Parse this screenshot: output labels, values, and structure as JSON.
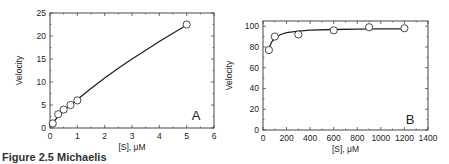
{
  "caption": "Figure 2.5  Michaelis",
  "chart_data": [
    {
      "type": "scatter",
      "panel": "A",
      "title": "",
      "xlabel": "[S], μM",
      "ylabel": "Velocity",
      "xlim": [
        0,
        6
      ],
      "ylim": [
        0,
        25
      ],
      "xticks": [
        0,
        1,
        2,
        3,
        4,
        5,
        6
      ],
      "yticks": [
        0,
        5,
        10,
        15,
        20,
        25
      ],
      "grid": false,
      "points": [
        {
          "x": 0.1,
          "y": 1.0
        },
        {
          "x": 0.3,
          "y": 3.0
        },
        {
          "x": 0.5,
          "y": 4.0
        },
        {
          "x": 0.75,
          "y": 5.0
        },
        {
          "x": 1.0,
          "y": 6.0
        },
        {
          "x": 5.0,
          "y": 22.5
        }
      ],
      "fit_curve": [
        [
          0.1,
          1.0
        ],
        [
          0.3,
          2.6
        ],
        [
          0.5,
          3.8
        ],
        [
          0.75,
          5.0
        ],
        [
          1.0,
          6.2
        ],
        [
          1.5,
          8.6
        ],
        [
          2.0,
          10.9
        ],
        [
          2.5,
          13.0
        ],
        [
          3.0,
          15.0
        ],
        [
          3.5,
          16.9
        ],
        [
          4.0,
          18.8
        ],
        [
          4.5,
          20.6
        ],
        [
          5.0,
          22.4
        ]
      ],
      "annotation": "A"
    },
    {
      "type": "scatter",
      "panel": "B",
      "title": "",
      "xlabel": "[S], μM",
      "ylabel": "Velocity",
      "xlim": [
        0,
        1400
      ],
      "ylim": [
        0,
        105
      ],
      "xticks": [
        0,
        200,
        400,
        600,
        800,
        1000,
        1200,
        1400
      ],
      "yticks": [
        0,
        20,
        40,
        60,
        80,
        100
      ],
      "grid": false,
      "points": [
        {
          "x": 50,
          "y": 77
        },
        {
          "x": 100,
          "y": 90
        },
        {
          "x": 300,
          "y": 92
        },
        {
          "x": 600,
          "y": 96
        },
        {
          "x": 900,
          "y": 99
        },
        {
          "x": 1200,
          "y": 98
        }
      ],
      "fit_curve": [
        [
          50,
          79
        ],
        [
          75,
          85
        ],
        [
          100,
          88.5
        ],
        [
          150,
          92
        ],
        [
          200,
          93.8
        ],
        [
          300,
          95.3
        ],
        [
          400,
          96.1
        ],
        [
          600,
          96.8
        ],
        [
          800,
          97.2
        ],
        [
          1000,
          97.4
        ],
        [
          1200,
          97.5
        ]
      ],
      "annotation": "B"
    }
  ]
}
